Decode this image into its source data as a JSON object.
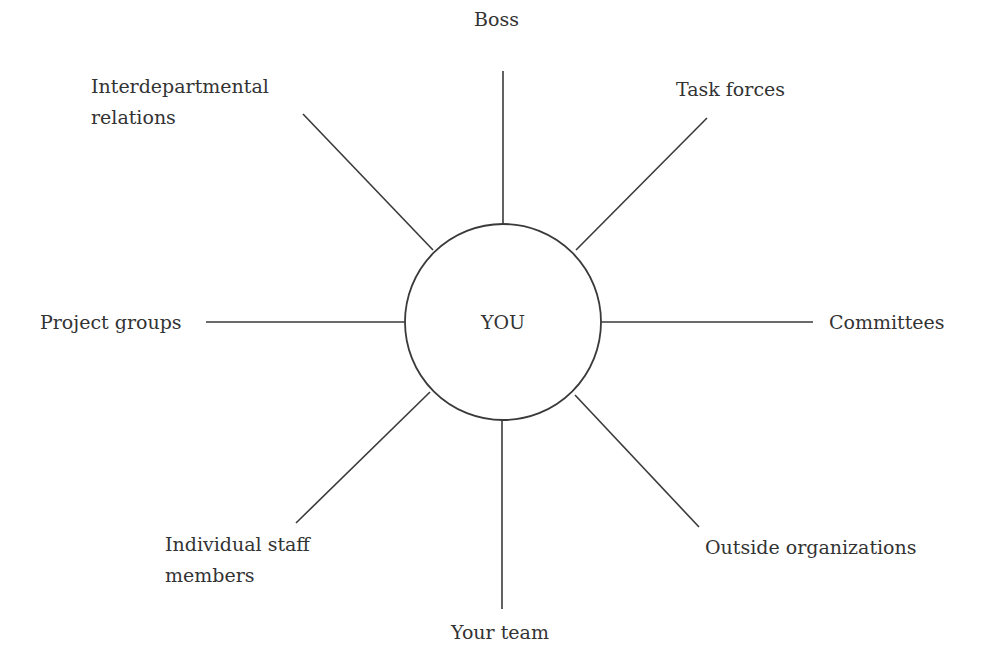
{
  "diagram": {
    "type": "radial-network",
    "center": {
      "label": "YOU",
      "cx": 503,
      "cy": 322,
      "r": 98
    },
    "colors": {
      "line": "#3a3a3a",
      "text": "#333333",
      "background": "#ffffff"
    },
    "nodes": [
      {
        "id": "boss",
        "label_lines": [
          "Boss"
        ],
        "direction": "N",
        "line": {
          "x1": 503,
          "y1": 71,
          "x2": 503,
          "y2": 224
        }
      },
      {
        "id": "task-forces",
        "label_lines": [
          "Task forces"
        ],
        "direction": "NE",
        "line": {
          "x1": 707,
          "y1": 118,
          "x2": 576,
          "y2": 250
        }
      },
      {
        "id": "committees",
        "label_lines": [
          "Committees"
        ],
        "direction": "E",
        "line": {
          "x1": 601,
          "y1": 322,
          "x2": 813,
          "y2": 322
        }
      },
      {
        "id": "outside-organizations",
        "label_lines": [
          "Outside organizations"
        ],
        "direction": "SE",
        "line": {
          "x1": 575,
          "y1": 395,
          "x2": 699,
          "y2": 527
        }
      },
      {
        "id": "your-team",
        "label_lines": [
          "Your team"
        ],
        "direction": "S",
        "line": {
          "x1": 502,
          "y1": 420,
          "x2": 502,
          "y2": 609
        }
      },
      {
        "id": "individual-staff-members",
        "label_lines": [
          "Individual staff",
          "members"
        ],
        "direction": "SW",
        "line": {
          "x1": 430,
          "y1": 392,
          "x2": 296,
          "y2": 523
        }
      },
      {
        "id": "project-groups",
        "label_lines": [
          "Project groups"
        ],
        "direction": "W",
        "line": {
          "x1": 206,
          "y1": 322,
          "x2": 405,
          "y2": 322
        }
      },
      {
        "id": "interdepartmental-relations",
        "label_lines": [
          "Interdepartmental",
          "relations"
        ],
        "direction": "NW",
        "line": {
          "x1": 303,
          "y1": 114,
          "x2": 433,
          "y2": 250
        }
      }
    ]
  }
}
